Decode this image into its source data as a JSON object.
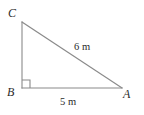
{
  "figure": {
    "name": "right-triangle-diagram",
    "background_color": "#ffffff",
    "stroke_color": "#8a8a8a",
    "text_color": "#2b2b2b",
    "width": 144,
    "height": 115,
    "vertices": {
      "C": {
        "label": "C",
        "x": 22,
        "y": 22
      },
      "B": {
        "label": "B",
        "x": 22,
        "y": 88
      },
      "A": {
        "label": "A",
        "x": 122,
        "y": 88
      }
    },
    "right_angle": {
      "at_vertex": "B",
      "marker_size": 8
    },
    "sides": {
      "hypotenuse": {
        "from": "C",
        "to": "A",
        "length_label": "6 m"
      },
      "base": {
        "from": "B",
        "to": "A",
        "length_label": "5 m"
      },
      "vertical_leg": {
        "from": "C",
        "to": "B",
        "length_label": ""
      }
    }
  }
}
